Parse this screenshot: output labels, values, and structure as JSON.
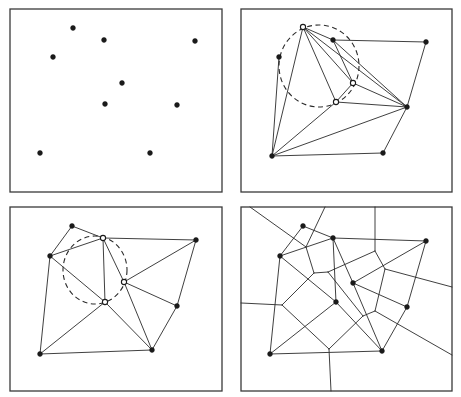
{
  "figure": {
    "width": 461,
    "height": 397,
    "background": "#ffffff",
    "stroke_color": "#2a2a2a"
  },
  "panels": [
    {
      "id": "point-set",
      "frame": {
        "x": 10,
        "y": 9,
        "w": 212,
        "h": 183
      },
      "points": [
        {
          "x": 73,
          "y": 28,
          "style": "filled"
        },
        {
          "x": 104,
          "y": 40,
          "style": "filled"
        },
        {
          "x": 195,
          "y": 41,
          "style": "filled"
        },
        {
          "x": 53,
          "y": 57,
          "style": "filled"
        },
        {
          "x": 122,
          "y": 83,
          "style": "filled"
        },
        {
          "x": 105,
          "y": 104,
          "style": "filled"
        },
        {
          "x": 177,
          "y": 105,
          "style": "filled"
        },
        {
          "x": 40,
          "y": 153,
          "style": "filled"
        },
        {
          "x": 150,
          "y": 153,
          "style": "filled"
        }
      ],
      "edges": [],
      "circles": [],
      "voronoi": []
    },
    {
      "id": "invalid-triangulation",
      "frame": {
        "x": 241,
        "y": 9,
        "w": 211,
        "h": 183
      },
      "points": [
        {
          "x": 303,
          "y": 27,
          "style": "hollow"
        },
        {
          "x": 333,
          "y": 40,
          "style": "filled"
        },
        {
          "x": 426,
          "y": 42,
          "style": "filled"
        },
        {
          "x": 279,
          "y": 57,
          "style": "filled"
        },
        {
          "x": 353,
          "y": 83,
          "style": "hollow"
        },
        {
          "x": 336,
          "y": 102,
          "style": "hollow"
        },
        {
          "x": 407,
          "y": 107,
          "style": "filled"
        },
        {
          "x": 272,
          "y": 156,
          "style": "filled"
        },
        {
          "x": 383,
          "y": 153,
          "style": "filled"
        }
      ],
      "edges": [
        [
          0,
          1
        ],
        [
          1,
          2
        ],
        [
          2,
          6
        ],
        [
          0,
          7
        ],
        [
          3,
          7
        ],
        [
          0,
          5
        ],
        [
          0,
          4
        ],
        [
          0,
          6
        ],
        [
          1,
          4
        ],
        [
          1,
          6
        ],
        [
          4,
          6
        ],
        [
          4,
          5
        ],
        [
          5,
          6
        ],
        [
          5,
          7
        ],
        [
          7,
          6
        ],
        [
          7,
          8
        ],
        [
          8,
          6
        ]
      ],
      "circles": [
        {
          "cx": 319,
          "cy": 66,
          "rx": 40,
          "ry": 41
        }
      ],
      "voronoi": []
    },
    {
      "id": "delaunay-triangulation",
      "frame": {
        "x": 10,
        "y": 207,
        "w": 212,
        "h": 184
      },
      "points": [
        {
          "x": 72,
          "y": 226,
          "style": "filled"
        },
        {
          "x": 103,
          "y": 238,
          "style": "hollow"
        },
        {
          "x": 196,
          "y": 240,
          "style": "filled"
        },
        {
          "x": 50,
          "y": 256,
          "style": "filled"
        },
        {
          "x": 124,
          "y": 282,
          "style": "hollow"
        },
        {
          "x": 105,
          "y": 302,
          "style": "hollow"
        },
        {
          "x": 177,
          "y": 306,
          "style": "filled"
        },
        {
          "x": 40,
          "y": 354,
          "style": "filled"
        },
        {
          "x": 152,
          "y": 350,
          "style": "filled"
        }
      ],
      "edges": [
        [
          0,
          1
        ],
        [
          0,
          3
        ],
        [
          3,
          1
        ],
        [
          1,
          2
        ],
        [
          1,
          5
        ],
        [
          1,
          4
        ],
        [
          4,
          2
        ],
        [
          4,
          6
        ],
        [
          4,
          8
        ],
        [
          2,
          6
        ],
        [
          6,
          8
        ],
        [
          3,
          5
        ],
        [
          3,
          7
        ],
        [
          5,
          7
        ],
        [
          5,
          8
        ],
        [
          7,
          8
        ]
      ],
      "circles": [
        {
          "cx": 95,
          "cy": 270,
          "rx": 32,
          "ry": 34
        }
      ],
      "voronoi": []
    },
    {
      "id": "voronoi-diagram",
      "frame": {
        "x": 241,
        "y": 207,
        "w": 211,
        "h": 184
      },
      "points": [
        {
          "x": 303,
          "y": 226,
          "style": "filled"
        },
        {
          "x": 333,
          "y": 238,
          "style": "filled"
        },
        {
          "x": 426,
          "y": 241,
          "style": "filled"
        },
        {
          "x": 280,
          "y": 256,
          "style": "filled"
        },
        {
          "x": 353,
          "y": 283,
          "style": "filled"
        },
        {
          "x": 336,
          "y": 302,
          "style": "filled"
        },
        {
          "x": 407,
          "y": 307,
          "style": "filled"
        },
        {
          "x": 270,
          "y": 354,
          "style": "filled"
        },
        {
          "x": 382,
          "y": 351,
          "style": "filled"
        }
      ],
      "edges": [
        [
          0,
          1
        ],
        [
          0,
          3
        ],
        [
          3,
          1
        ],
        [
          1,
          2
        ],
        [
          1,
          5
        ],
        [
          1,
          4
        ],
        [
          4,
          2
        ],
        [
          4,
          6
        ],
        [
          4,
          8
        ],
        [
          2,
          6
        ],
        [
          6,
          8
        ],
        [
          3,
          5
        ],
        [
          3,
          7
        ],
        [
          5,
          7
        ],
        [
          5,
          8
        ],
        [
          7,
          8
        ]
      ],
      "circles": [],
      "voronoi": [
        [
          250,
          207,
          306,
          247
        ],
        [
          325,
          207,
          306,
          247
        ],
        [
          306,
          247,
          314,
          273
        ],
        [
          314,
          273,
          328,
          272
        ],
        [
          314,
          273,
          282,
          305
        ],
        [
          241,
          303,
          282,
          305
        ],
        [
          282,
          305,
          329,
          349
        ],
        [
          329,
          349,
          331,
          391
        ],
        [
          328,
          272,
          375,
          251
        ],
        [
          375,
          251,
          375,
          207
        ],
        [
          375,
          251,
          385,
          269
        ],
        [
          385,
          269,
          452,
          287
        ],
        [
          385,
          269,
          375,
          311
        ],
        [
          375,
          311,
          452,
          355
        ],
        [
          375,
          311,
          363,
          316
        ],
        [
          363,
          316,
          329,
          349
        ],
        [
          328,
          272,
          363,
          316
        ]
      ]
    }
  ]
}
